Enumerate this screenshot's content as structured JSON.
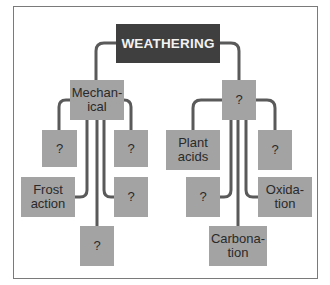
{
  "diagram": {
    "title": "WEATHERING",
    "colors": {
      "root_fill": "#3f3f3f",
      "root_text": "#f2f2f2",
      "node_fill": "#a3a3a3",
      "node_text": "#2a2a2a",
      "connector": "#5a5a5a",
      "frame": "#7a7a7a"
    },
    "root": {
      "label": "WEATHERING"
    },
    "branches": [
      {
        "label": "Mechan-\nical",
        "children": [
          {
            "label": "?"
          },
          {
            "label": "?"
          },
          {
            "label": "Frost\naction"
          },
          {
            "label": "?"
          },
          {
            "label": "?"
          }
        ]
      },
      {
        "label": "?",
        "children": [
          {
            "label": "Plant\nacids"
          },
          {
            "label": "?"
          },
          {
            "label": "?"
          },
          {
            "label": "Oxida-\ntion"
          },
          {
            "label": "Carbona-\ntion"
          }
        ]
      }
    ]
  }
}
